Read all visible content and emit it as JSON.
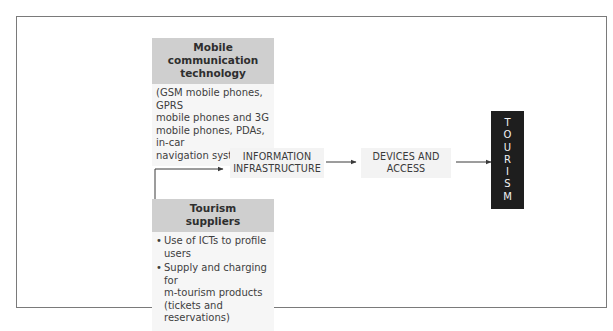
{
  "diagram": {
    "mobile_tech": {
      "title": "Mobile communication technology",
      "title_line1": "Mobile communication",
      "title_line2": "technology",
      "body_lines": [
        "(GSM mobile phones, GPRS",
        "mobile phones and 3G",
        "mobile phones, PDAs, in-car",
        "navigation systems)"
      ]
    },
    "tourism_suppliers": {
      "title_line1": "Tourism",
      "title_line2": "suppliers",
      "bullets": [
        {
          "lines": [
            "Use of ICTs to profile users"
          ]
        },
        {
          "lines": [
            "Supply and charging for",
            "m-tourism products",
            "(tickets and reservations)"
          ]
        }
      ]
    },
    "info_infra": {
      "line1": "INFORMATION",
      "line2": "INFRASTRUCTURE"
    },
    "devices": {
      "line1": "DEVICES AND",
      "line2": "ACCESS"
    },
    "tourism": {
      "letters": [
        "T",
        "O",
        "U",
        "R",
        "I",
        "S",
        "M"
      ]
    },
    "colors": {
      "header_fill": "#cfcfcf",
      "box_fill": "#f3f3f3",
      "tourism_fill": "#1e1e1e",
      "line": "#3a3a3a",
      "frame": "#7a7a7a"
    },
    "edges": [
      {
        "from": "mobile_tech",
        "to": "info_infra"
      },
      {
        "from": "tourism_suppliers",
        "to": "info_infra"
      },
      {
        "from": "info_infra",
        "to": "devices"
      },
      {
        "from": "devices",
        "to": "tourism"
      }
    ]
  }
}
